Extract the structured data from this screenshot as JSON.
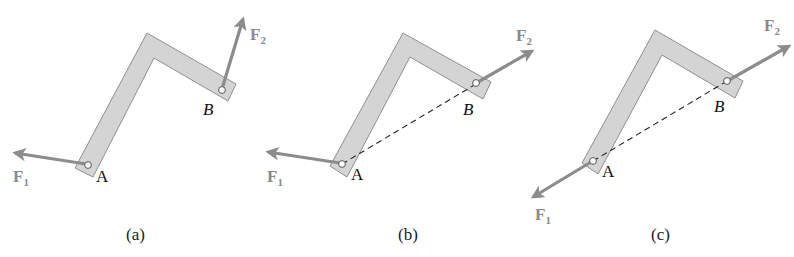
{
  "figure": {
    "panels": [
      {
        "id": "a",
        "caption": "(a)",
        "point_a_label": "A",
        "point_b_label": "B",
        "force1": {
          "symbol": "F",
          "subscript": "1"
        },
        "force2": {
          "symbol": "F",
          "subscript": "2"
        },
        "has_dashed_line_ab": false
      },
      {
        "id": "b",
        "caption": "(b)",
        "point_a_label": "A",
        "point_b_label": "B",
        "force1": {
          "symbol": "F",
          "subscript": "1"
        },
        "force2": {
          "symbol": "F",
          "subscript": "2"
        },
        "has_dashed_line_ab": true
      },
      {
        "id": "c",
        "caption": "(c)",
        "point_a_label": "A",
        "point_b_label": "B",
        "force1": {
          "symbol": "F",
          "subscript": "1"
        },
        "force2": {
          "symbol": "F",
          "subscript": "2"
        },
        "has_dashed_line_ab": true
      }
    ],
    "colors": {
      "bracket_fill": "#d4d4d4",
      "bracket_stroke": "#8f8f8f",
      "arrow": "#8c8c8c",
      "force_label": "#8a8a8a",
      "dashed_line": "#222222"
    }
  }
}
